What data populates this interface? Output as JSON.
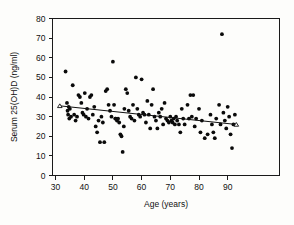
{
  "figure": {
    "name": "serum-vitamin-d-vs-age-scatter",
    "background_color": "#fdfdfb",
    "point_color": "#0a0a0a",
    "line_color": "#111111"
  },
  "chart_data": {
    "type": "scatter",
    "title": "",
    "xlabel": "Age (years)",
    "ylabel": "Serum 25(OH)D (ng/ml)",
    "xlim": [
      28,
      96
    ],
    "ylim": [
      0,
      80
    ],
    "xticks": [
      30,
      40,
      50,
      60,
      70,
      80,
      90
    ],
    "yticks": [
      0,
      10,
      20,
      30,
      40,
      50,
      60,
      70,
      80
    ],
    "xtick_labels": [
      "30",
      "40",
      "50",
      "60",
      "70",
      "80",
      "90"
    ],
    "ytick_labels": [
      "0",
      "10",
      "20",
      "30",
      "40",
      "50",
      "60",
      "70",
      "80"
    ],
    "grid": false,
    "legend": "none",
    "series": [
      {
        "name": "Subjects",
        "marker": "filled-circle",
        "points": [
          [
            33.5,
            53
          ],
          [
            34.0,
            37
          ],
          [
            34.2,
            33
          ],
          [
            34.4,
            31
          ],
          [
            34.6,
            35
          ],
          [
            34.8,
            29
          ],
          [
            35.0,
            34
          ],
          [
            35.4,
            30
          ],
          [
            36.0,
            46
          ],
          [
            36.5,
            31
          ],
          [
            37.0,
            28
          ],
          [
            37.5,
            30
          ],
          [
            38.0,
            41
          ],
          [
            38.5,
            40
          ],
          [
            39.0,
            37
          ],
          [
            39.4,
            32
          ],
          [
            39.8,
            31
          ],
          [
            40.2,
            42
          ],
          [
            40.6,
            30
          ],
          [
            41.0,
            34
          ],
          [
            41.5,
            29
          ],
          [
            42.0,
            40
          ],
          [
            42.5,
            41
          ],
          [
            43.0,
            31
          ],
          [
            43.5,
            35
          ],
          [
            44.0,
            25
          ],
          [
            44.5,
            22
          ],
          [
            45.0,
            28
          ],
          [
            45.5,
            17
          ],
          [
            46.0,
            30
          ],
          [
            46.5,
            27
          ],
          [
            47.0,
            17
          ],
          [
            47.5,
            43
          ],
          [
            48.0,
            44
          ],
          [
            48.5,
            36
          ],
          [
            49.0,
            33
          ],
          [
            49.5,
            30
          ],
          [
            50.0,
            58
          ],
          [
            50.4,
            36
          ],
          [
            50.8,
            29
          ],
          [
            51.0,
            29
          ],
          [
            51.4,
            28
          ],
          [
            51.8,
            29
          ],
          [
            52.2,
            27
          ],
          [
            52.6,
            21
          ],
          [
            53.0,
            20
          ],
          [
            53.4,
            12
          ],
          [
            53.8,
            25
          ],
          [
            54.0,
            34
          ],
          [
            54.5,
            44
          ],
          [
            55.0,
            42
          ],
          [
            55.5,
            33
          ],
          [
            56.0,
            30
          ],
          [
            56.5,
            29
          ],
          [
            57.0,
            36
          ],
          [
            57.5,
            28
          ],
          [
            58.0,
            50
          ],
          [
            58.5,
            34
          ],
          [
            59.0,
            31
          ],
          [
            59.5,
            30
          ],
          [
            60.0,
            49
          ],
          [
            60.5,
            32
          ],
          [
            61.0,
            31
          ],
          [
            61.5,
            27
          ],
          [
            62.0,
            38
          ],
          [
            62.5,
            31
          ],
          [
            63.0,
            24
          ],
          [
            63.5,
            36
          ],
          [
            64.0,
            44
          ],
          [
            64.5,
            30
          ],
          [
            65.0,
            28
          ],
          [
            65.5,
            24
          ],
          [
            66.0,
            32
          ],
          [
            66.5,
            30
          ],
          [
            67.0,
            34
          ],
          [
            67.5,
            26
          ],
          [
            68.0,
            37
          ],
          [
            68.5,
            29
          ],
          [
            69.0,
            28
          ],
          [
            69.5,
            27
          ],
          [
            70.0,
            30
          ],
          [
            70.4,
            28
          ],
          [
            70.8,
            27
          ],
          [
            71.2,
            29
          ],
          [
            71.6,
            26
          ],
          [
            72.0,
            30
          ],
          [
            72.4,
            28
          ],
          [
            73.0,
            26
          ],
          [
            73.5,
            22
          ],
          [
            74.0,
            34
          ],
          [
            74.5,
            29
          ],
          [
            75.0,
            26
          ],
          [
            76.0,
            36
          ],
          [
            76.5,
            29
          ],
          [
            77.0,
            41
          ],
          [
            77.5,
            30
          ],
          [
            78.0,
            41
          ],
          [
            78.5,
            25
          ],
          [
            79.0,
            29
          ],
          [
            80.0,
            34
          ],
          [
            80.5,
            22
          ],
          [
            81.0,
            28
          ],
          [
            82.0,
            19
          ],
          [
            83.0,
            21
          ],
          [
            84.0,
            31
          ],
          [
            84.5,
            26
          ],
          [
            85.0,
            22
          ],
          [
            85.5,
            19
          ],
          [
            86.0,
            29
          ],
          [
            87.0,
            36
          ],
          [
            87.5,
            26
          ],
          [
            88.0,
            72
          ],
          [
            88.5,
            32
          ],
          [
            89.0,
            28
          ],
          [
            89.5,
            24
          ],
          [
            90.0,
            35
          ],
          [
            90.5,
            30
          ],
          [
            91.0,
            21
          ],
          [
            91.5,
            14
          ],
          [
            92.0,
            26
          ],
          [
            92.5,
            31
          ]
        ]
      }
    ],
    "trend_line": {
      "name": "regression-line",
      "x_start": 31.5,
      "y_start": 35.5,
      "x_end": 93.0,
      "y_end": 26.0,
      "endpoint_marker": "open-triangle"
    }
  }
}
